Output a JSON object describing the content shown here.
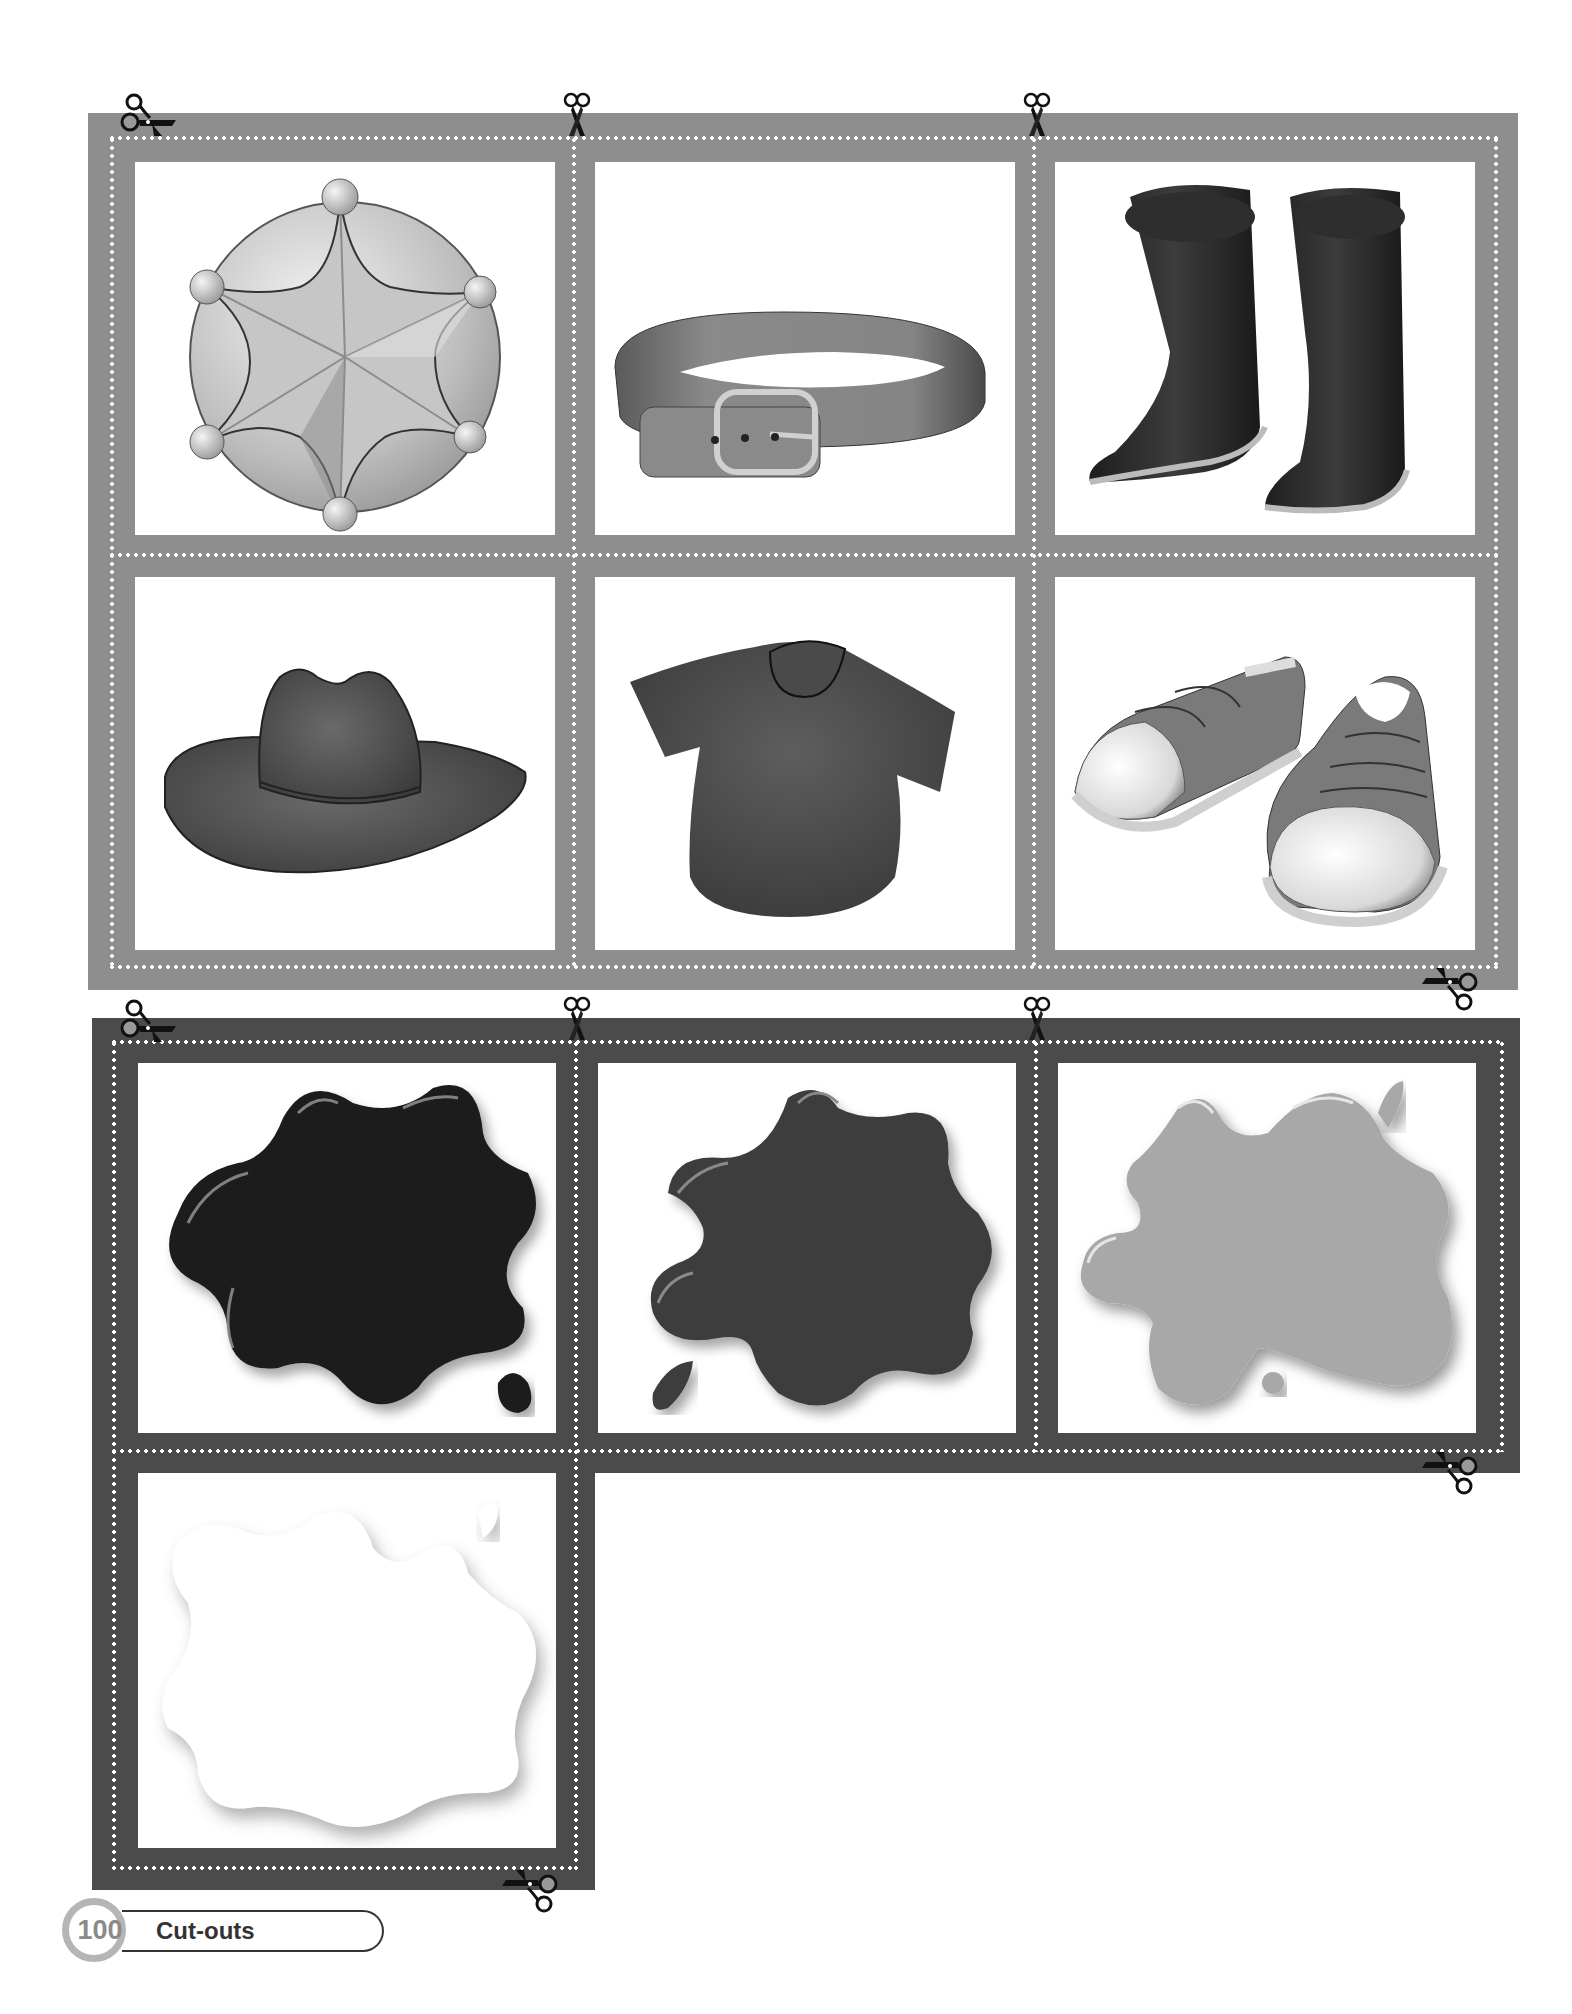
{
  "page": {
    "number": "100",
    "section_title": "Cut-outs"
  },
  "colors": {
    "top_frame": "#8e8e8e",
    "bottom_frame": "#4b4b4b",
    "page_badge_ring": "#b5b5b5"
  },
  "top_sheet": {
    "cards": [
      {
        "id": "sheriff-badge",
        "label": "sheriff badge"
      },
      {
        "id": "belt",
        "label": "belt"
      },
      {
        "id": "boots",
        "label": "boots"
      },
      {
        "id": "cowboy-hat",
        "label": "cowboy hat"
      },
      {
        "id": "t-shirt",
        "label": "t-shirt"
      },
      {
        "id": "sneakers",
        "label": "sneakers"
      }
    ]
  },
  "bottom_sheet": {
    "cards": [
      {
        "id": "black-paint-splat",
        "label": "black paint splat",
        "color": "#1e1e1e"
      },
      {
        "id": "dark-gray-paint-splat",
        "label": "dark gray paint splat",
        "color": "#3e3e3e"
      },
      {
        "id": "light-gray-paint-splat",
        "label": "light gray paint splat",
        "color": "#a8a8a8"
      },
      {
        "id": "white-paint-splat",
        "label": "white paint splat",
        "color": "#ffffff"
      }
    ]
  },
  "icons": {
    "cut_marker": "scissors-icon"
  }
}
